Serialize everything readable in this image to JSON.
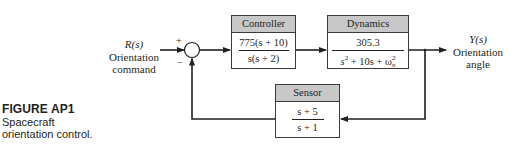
{
  "figure": {
    "label": "FIGURE AP1",
    "caption_line1": "Spacecraft",
    "caption_line2": "orientation control."
  },
  "input": {
    "symbol": "R(s)",
    "name_line1": "Orientation",
    "name_line2": "command"
  },
  "output": {
    "symbol": "Y(s)",
    "name_line1": "Orientation",
    "name_line2": "angle"
  },
  "summing_junction": {
    "plus_sign": "+",
    "minus_sign": "−"
  },
  "blocks": {
    "controller": {
      "title": "Controller",
      "numerator": "775(s + 10)",
      "denominator": "s(s + 2)"
    },
    "dynamics": {
      "title": "Dynamics",
      "numerator": "305.3",
      "denominator_pre": "s",
      "denominator_exp": "2",
      "denominator_mid": " + 10s + ω",
      "denominator_sub": "n",
      "denominator_sup": "2"
    },
    "sensor": {
      "title": "Sensor",
      "numerator": "s + 5",
      "denominator": "s + 1"
    }
  },
  "colors": {
    "line": "#231f20",
    "block_header": "#c8c8c8",
    "block_border": "#3a3a3a"
  }
}
